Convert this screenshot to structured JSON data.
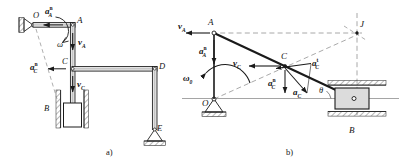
{
  "figure": {
    "caption_a": "a)",
    "caption_b": "b)"
  },
  "diagram_a": {
    "name": "crank-slider-linkage-mechanism",
    "points": {
      "O": "O",
      "A": "A",
      "B": "B",
      "C": "C",
      "D": "D",
      "E": "E"
    },
    "vectors": {
      "omega": "ω",
      "v_A": "v",
      "v_A_sub": "A",
      "v_C": "v",
      "v_C_sub": "C",
      "a_A_n": "a",
      "a_A_n_sub": "A",
      "a_A_n_sup": "n",
      "a_C_n": "a",
      "a_C_n_sub": "C",
      "a_C_n_sup": "n"
    }
  },
  "diagram_b": {
    "name": "velocity-acceleration-vector-diagram",
    "points": {
      "A": "A",
      "B": "B",
      "C": "C",
      "J": "J",
      "O": "O"
    },
    "angle": "θ",
    "vectors": {
      "omega_0": "ω",
      "omega_0_sub": "0",
      "v_A": "v",
      "v_A_sub": "A",
      "v_C": "v",
      "v_C_sub": "C",
      "a_A_n": "a",
      "a_A_n_sub": "A",
      "a_A_n_sup": "n",
      "a_C_n": "a",
      "a_C_n_sub": "C",
      "a_C_n_sup": "n",
      "a_C_t": "a",
      "a_C_t_sub": "C",
      "a_C_t_sup": "t",
      "a_C": "a",
      "a_C_sub": "C"
    }
  },
  "colors": {
    "line": "#1a1a1a",
    "thin": "#6e6e6e",
    "dashed": "#8c8c8c",
    "fill_light": "#d9d9d9",
    "fill_block": "#d0d0d0",
    "background": "#ffffff"
  }
}
